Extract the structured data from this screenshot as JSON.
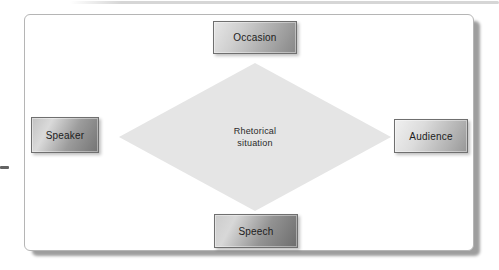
{
  "diagram": {
    "center": {
      "line1": "Rhetorical",
      "line2": "situation"
    },
    "nodes": {
      "top": {
        "label": "Occasion"
      },
      "left": {
        "label": "Speaker"
      },
      "right": {
        "label": "Audience"
      },
      "bottom": {
        "label": "Speech"
      }
    }
  },
  "colors": {
    "diamond_fill": "#e5e5e5",
    "panel_border": "#b5b5b5",
    "box_border": "#6f6f6f",
    "label_text": "#1c1c1c",
    "panel_shadow": "#9e9e9e"
  }
}
